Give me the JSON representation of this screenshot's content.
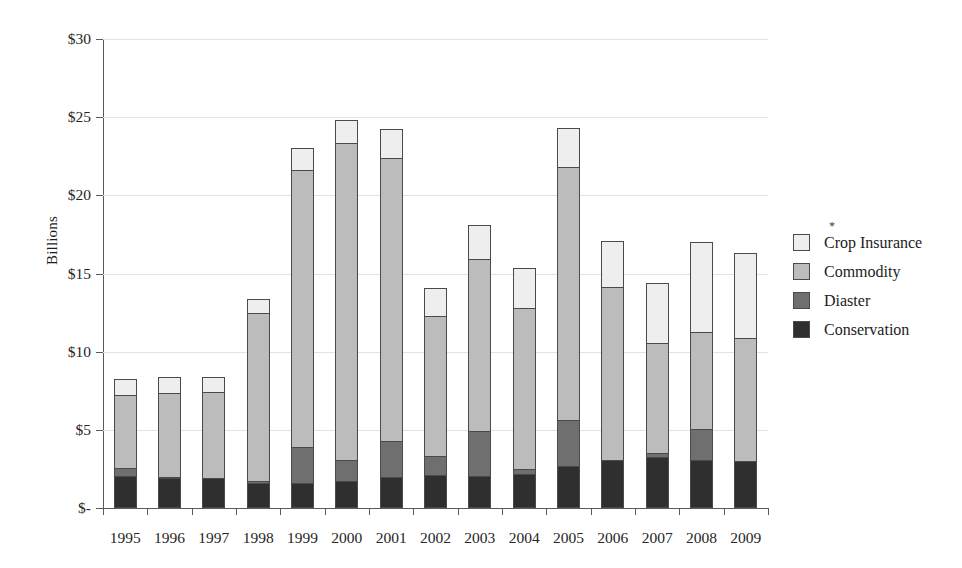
{
  "chart_data": {
    "type": "bar",
    "stacked": true,
    "title": "",
    "xlabel": "",
    "ylabel": "Billions",
    "ylim": [
      0,
      30
    ],
    "ytick_values": [
      30,
      25,
      20,
      15,
      10,
      5,
      0
    ],
    "ytick_labels": [
      "$30",
      "$25",
      "$20",
      "$15",
      "$10",
      "$5",
      "$-"
    ],
    "grid": true,
    "legend_position": "right",
    "legend_note": "*",
    "categories": [
      "1995",
      "1996",
      "1997",
      "1998",
      "1999",
      "2000",
      "2001",
      "2002",
      "2003",
      "2004",
      "2005",
      "2006",
      "2007",
      "2008",
      "2009"
    ],
    "series": [
      {
        "name": "Conservation",
        "color": "#2f2f2f",
        "values": [
          2.05,
          1.95,
          1.9,
          1.6,
          1.6,
          1.7,
          2.0,
          2.1,
          2.05,
          2.2,
          2.7,
          3.05,
          3.25,
          3.05,
          3.0
        ]
      },
      {
        "name": "Diaster",
        "color": "#6f6f6f",
        "values": [
          0.5,
          0.05,
          0.05,
          0.1,
          2.3,
          1.4,
          2.3,
          1.2,
          2.85,
          0.3,
          2.95,
          0.0,
          0.25,
          2.0,
          0.0
        ]
      },
      {
        "name": "Commodity",
        "color": "#bcbcbc",
        "values": [
          4.65,
          5.35,
          5.5,
          10.8,
          17.7,
          20.25,
          18.1,
          9.0,
          11.05,
          10.3,
          16.15,
          11.1,
          7.05,
          6.2,
          7.85
        ]
      },
      {
        "name": "Crop Insurance",
        "color": "#eeeeee",
        "values": [
          1.05,
          1.05,
          0.95,
          0.9,
          1.4,
          1.45,
          1.85,
          1.8,
          2.15,
          2.55,
          2.5,
          2.9,
          3.85,
          5.75,
          5.45
        ]
      }
    ],
    "totals": [
      8.25,
      8.4,
      8.4,
      13.4,
      23.0,
      24.8,
      24.25,
      14.1,
      18.1,
      15.35,
      24.3,
      17.05,
      14.4,
      17.0,
      16.3
    ]
  },
  "legend": {
    "note": "*",
    "items": [
      {
        "label": "Crop Insurance",
        "swatch": "#eeeeee",
        "icon": "legend-swatch-crop-insurance"
      },
      {
        "label": "Commodity",
        "swatch": "#bcbcbc",
        "icon": "legend-swatch-commodity"
      },
      {
        "label": "Diaster",
        "swatch": "#6f6f6f",
        "icon": "legend-swatch-diaster"
      },
      {
        "label": "Conservation",
        "swatch": "#2f2f2f",
        "icon": "legend-swatch-conservation"
      }
    ]
  }
}
